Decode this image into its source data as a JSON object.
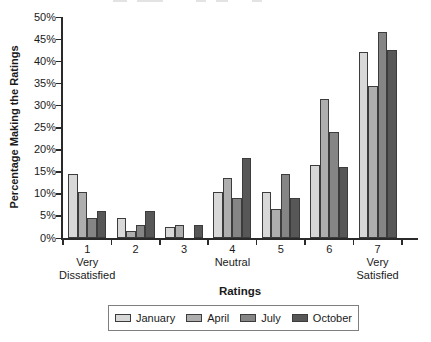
{
  "chart_data": {
    "type": "bar",
    "categories": [
      "1",
      "2",
      "3",
      "4",
      "5",
      "6",
      "7"
    ],
    "category_sublabels": [
      [
        "Very",
        "Dissatisfied"
      ],
      [],
      [],
      [
        "Neutral"
      ],
      [],
      [],
      [
        "Very",
        "Satisfied"
      ]
    ],
    "series": [
      {
        "name": "January",
        "color": "#d8d8d8",
        "values": [
          14.5,
          4.5,
          2.5,
          10.5,
          10.5,
          16.5,
          42
        ]
      },
      {
        "name": "April",
        "color": "#aeaeae",
        "values": [
          10.5,
          1.5,
          3,
          13.5,
          6.5,
          31.5,
          34.5
        ]
      },
      {
        "name": "July",
        "color": "#858585",
        "values": [
          4.5,
          3,
          0,
          9,
          14.5,
          24,
          46.5
        ]
      },
      {
        "name": "October",
        "color": "#575757",
        "values": [
          6,
          6,
          3,
          18,
          9,
          16,
          42.5
        ]
      }
    ],
    "xlabel": "Ratings",
    "ylabel": "Percentage Making the Ratings",
    "ylim": [
      0,
      50
    ],
    "ytick_step": 5,
    "ytick_labels": [
      "0%",
      "5%",
      "10%",
      "15%",
      "20%",
      "25%",
      "30%",
      "35%",
      "40%",
      "45%",
      "50%"
    ],
    "legend_position": "bottom",
    "grid": false,
    "bar_border_color": "#3c3c3c",
    "axis_color": "#2a2a2a"
  }
}
